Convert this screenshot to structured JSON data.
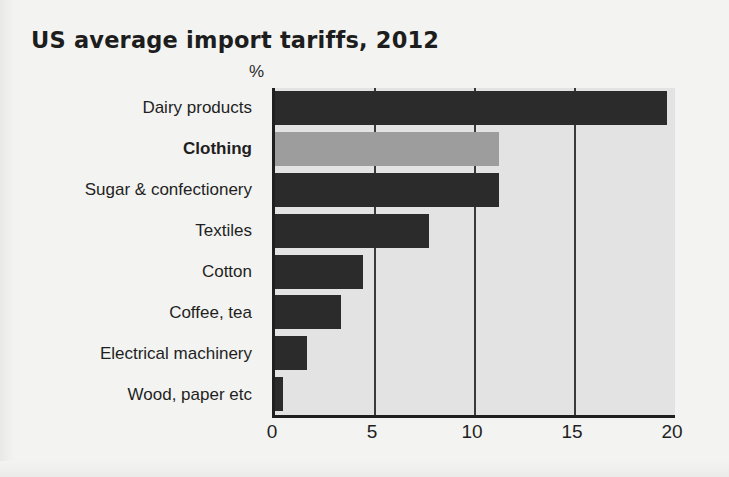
{
  "chart_data": {
    "type": "bar",
    "orientation": "horizontal",
    "title": "US average import tariffs, 2012",
    "unit_label": "%",
    "xlabel": "",
    "ylabel": "",
    "xlim": [
      0,
      20
    ],
    "xticks": [
      0,
      5,
      10,
      15,
      20
    ],
    "xtick_labels": [
      "0",
      "5",
      "10",
      "15",
      "20"
    ],
    "grid": true,
    "grid_axis": "x",
    "legend": "none",
    "categories": [
      "Dairy products",
      "Clothing",
      "Sugar & confectionery",
      "Textiles",
      "Cotton",
      "Coffee, tea",
      "Electrical machinery",
      "Wood, paper etc"
    ],
    "values": [
      19.6,
      11.2,
      11.2,
      7.7,
      4.4,
      3.3,
      1.6,
      0.4
    ],
    "highlight_category": "Clothing",
    "bars": [
      {
        "category": "Dairy products",
        "value": 19.6,
        "highlighted": false
      },
      {
        "category": "Clothing",
        "value": 11.2,
        "highlighted": true
      },
      {
        "category": "Sugar & confectionery",
        "value": 11.2,
        "highlighted": false
      },
      {
        "category": "Textiles",
        "value": 7.7,
        "highlighted": false
      },
      {
        "category": "Cotton",
        "value": 4.4,
        "highlighted": false
      },
      {
        "category": "Coffee, tea",
        "value": 3.3,
        "highlighted": false
      },
      {
        "category": "Electrical machinery",
        "value": 1.6,
        "highlighted": false
      },
      {
        "category": "Wood, paper etc",
        "value": 0.4,
        "highlighted": false
      }
    ]
  },
  "colors": {
    "page_background": "#f3f3f1",
    "plot_background": "#e3e3e3",
    "bar": "#2b2b2b",
    "bar_highlight": "#9d9d9d",
    "axis": "#1f1f1f",
    "gridline": "#3a3a3a",
    "text": "#1d1d1d"
  }
}
